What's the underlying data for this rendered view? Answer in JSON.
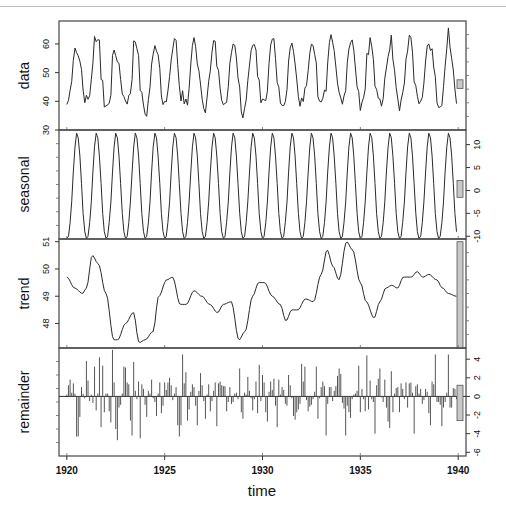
{
  "chart_data": {
    "type": "line",
    "title": "",
    "subtitle": "STL decomposition (seasonal + trend + remainder)",
    "xlabel": "time",
    "x_ticks": [
      1920,
      1925,
      1930,
      1935,
      1940
    ],
    "xlim": [
      1919.6,
      1940.4
    ],
    "frequency": 12,
    "start": 1920,
    "grid": false,
    "legend": "none",
    "panels": [
      {
        "name": "data",
        "ylabel": "data",
        "axis_side": "left",
        "y_ticks": [
          30,
          40,
          50,
          60
        ],
        "ylim": [
          30,
          68
        ],
        "style": "line",
        "range_bar": {
          "from": 44.5,
          "to": 47.5
        },
        "yearly_peaks": [
          58,
          66,
          57,
          64,
          61,
          64,
          63,
          61,
          63,
          60,
          62,
          63,
          64,
          66,
          62,
          64,
          59,
          60,
          61,
          62
        ],
        "yearly_troughs": [
          40,
          39,
          37,
          35,
          38,
          40,
          36,
          37,
          32,
          35,
          37,
          38,
          37,
          39,
          35,
          40,
          36,
          37,
          38,
          37
        ]
      },
      {
        "name": "seasonal",
        "ylabel": "seasonal",
        "axis_side": "right",
        "y_ticks": [
          -10,
          -5,
          0,
          5,
          10
        ],
        "ylim": [
          -10.6,
          13.2
        ],
        "style": "line",
        "range_bar": {
          "from": -1.5,
          "to": 2.2
        },
        "monthly_pattern": [
          -10.5,
          -10.0,
          -7.0,
          -2.5,
          4.0,
          9.5,
          12.5,
          11.5,
          7.5,
          1.5,
          -5.0,
          -9.0
        ]
      },
      {
        "name": "trend",
        "ylabel": "trend",
        "axis_side": "left",
        "y_ticks": [
          48,
          49,
          50,
          51
        ],
        "ylim": [
          47.1,
          51.1
        ],
        "style": "line",
        "range_bar": {
          "from": 47.1,
          "to": 51.0
        },
        "knots_x": [
          1920.0,
          1920.4,
          1920.8,
          1921.0,
          1921.3,
          1921.6,
          1922.0,
          1922.4,
          1922.6,
          1923.0,
          1923.4,
          1923.7,
          1924.0,
          1924.4,
          1924.7,
          1925.1,
          1925.4,
          1925.8,
          1926.1,
          1926.5,
          1926.9,
          1927.3,
          1927.7,
          1928.0,
          1928.4,
          1928.8,
          1929.1,
          1929.5,
          1929.8,
          1930.1,
          1930.5,
          1930.9,
          1931.2,
          1931.5,
          1931.8,
          1932.2,
          1932.6,
          1933.0,
          1933.3,
          1933.6,
          1933.9,
          1934.3,
          1934.6,
          1935.0,
          1935.3,
          1935.7,
          1936.0,
          1936.3,
          1936.6,
          1936.9,
          1937.2,
          1937.6,
          1937.9,
          1938.2,
          1938.5,
          1938.9,
          1939.2,
          1939.5,
          1939.9
        ],
        "values": [
          49.7,
          49.3,
          49.1,
          49.3,
          50.5,
          50.2,
          49.1,
          47.4,
          47.4,
          48.0,
          48.4,
          47.3,
          47.4,
          47.7,
          49.0,
          49.6,
          49.7,
          48.7,
          48.7,
          49.2,
          49.0,
          48.7,
          48.4,
          48.7,
          48.8,
          47.4,
          47.7,
          49.0,
          49.5,
          49.5,
          49.0,
          48.7,
          48.1,
          48.5,
          48.5,
          48.9,
          48.8,
          49.8,
          50.7,
          50.1,
          49.6,
          51.0,
          50.7,
          49.5,
          48.8,
          48.2,
          48.8,
          49.3,
          49.4,
          49.3,
          49.7,
          49.7,
          49.9,
          49.7,
          49.8,
          49.6,
          49.3,
          49.1,
          49.0
        ]
      },
      {
        "name": "remainder",
        "ylabel": "remainder",
        "axis_side": "right",
        "y_ticks": [
          -6,
          -4,
          -2,
          0,
          2,
          4
        ],
        "ylim": [
          -6.4,
          5.2
        ],
        "style": "histogram",
        "zero_line": true,
        "range_bar": {
          "from": -2.6,
          "to": 1.2
        },
        "values": [
          0.2,
          1.2,
          1.8,
          0.4,
          1.4,
          0.3,
          -4.3,
          -4.3,
          -2.2,
          1.0,
          0.3,
          -0.2,
          3.8,
          1.7,
          -0.5,
          0.2,
          -0.7,
          3.2,
          -1.5,
          0.3,
          4.2,
          -3.3,
          3.3,
          -1.7,
          0.3,
          0.3,
          -1.6,
          -2.8,
          5.0,
          1.5,
          -3.5,
          -4.7,
          -1.2,
          -0.9,
          0.3,
          3.2,
          3.1,
          1.5,
          1.3,
          -2.6,
          -4.2,
          3.7,
          0.6,
          -0.3,
          1.6,
          -4.5,
          1.3,
          0.8,
          -0.9,
          -2.2,
          0.6,
          0.3,
          1.8,
          -0.2,
          -0.6,
          -2.1,
          0.3,
          1.5,
          -1.8,
          -1.0,
          1.5,
          0.7,
          1.5,
          2.0,
          1.2,
          -0.4,
          0.3,
          1.0,
          -3.1,
          -4.3,
          -3.1,
          4.5,
          1.4,
          2.6,
          -2.6,
          -1.4,
          0.5,
          1.3,
          1.0,
          -1.0,
          -3.1,
          0.6,
          2.5,
          1.2,
          -0.5,
          -2.4,
          0.2,
          1.3,
          -1.6,
          -0.5,
          0.6,
          1.5,
          -3.2,
          1.4,
          1.6,
          1.2,
          1.1,
          1.1,
          -1.6,
          -0.6,
          1.0,
          -0.8,
          -0.6,
          0.3,
          0.4,
          -0.3,
          3.0,
          -1.7,
          -2.4,
          0.4,
          0.2,
          2.1,
          0.6,
          -0.2,
          -1.5,
          -0.3,
          1.6,
          -1.8,
          3.4,
          -0.5,
          2.3,
          1.5,
          -1.7,
          -2.7,
          0.5,
          1.6,
          0.7,
          1.9,
          -1.0,
          -3.3,
          1.8,
          0.2,
          1.0,
          0.7,
          -0.8,
          -1.0,
          2.3,
          1.2,
          -0.2,
          -2.1,
          -2.5,
          -1.7,
          -1.4,
          -0.8,
          3.5,
          1.6,
          3.2,
          -0.4,
          -1.6,
          -1.1,
          -0.9,
          -0.3,
          0.5,
          3.2,
          -2.4,
          -0.2,
          1.0,
          1.6,
          1.1,
          -4.2,
          -0.8,
          1.0,
          1.0,
          -0.5,
          0.6,
          1.1,
          2.2,
          3.0,
          2.4,
          -0.7,
          -1.3,
          -4.2,
          -1.0,
          -1.7,
          -2.3,
          -0.3,
          0.2,
          0.3,
          0.6,
          3.3,
          -1.7,
          0.8,
          -0.3,
          -1.6,
          4.4,
          -1.4,
          1.7,
          -0.3,
          -0.6,
          -4.0,
          1.2,
          1.9,
          3.0,
          -0.1,
          -0.6,
          1.8,
          -1.2,
          -2.7,
          -3.4,
          2.7,
          -1.7,
          0.3,
          0.9,
          1.0,
          -1.7,
          1.4,
          0.8,
          -0.3,
          1.5,
          -1.2,
          1.4,
          1.5,
          0.4,
          -4.0,
          1.1,
          1.3,
          0.3,
          0.8,
          -0.8,
          -0.4,
          0.8,
          0.5,
          -1.8,
          -3.1,
          1.6,
          1.3,
          4.5,
          -0.6,
          -0.6,
          -0.9,
          -3.2,
          -1.2,
          -0.6,
          0.4,
          4.5,
          -1.2,
          -1.2,
          0.9,
          0.8,
          -0.3
        ]
      }
    ]
  },
  "labels": {
    "xlabel": "time",
    "data": "data",
    "seasonal": "seasonal",
    "trend": "trend",
    "remainder": "remainder"
  },
  "colors": {
    "line": "#2a2a2a",
    "axis": "#333333",
    "range_bar_fill": "#c8c8c8",
    "range_bar_stroke": "#555555",
    "frame": "#444444"
  }
}
